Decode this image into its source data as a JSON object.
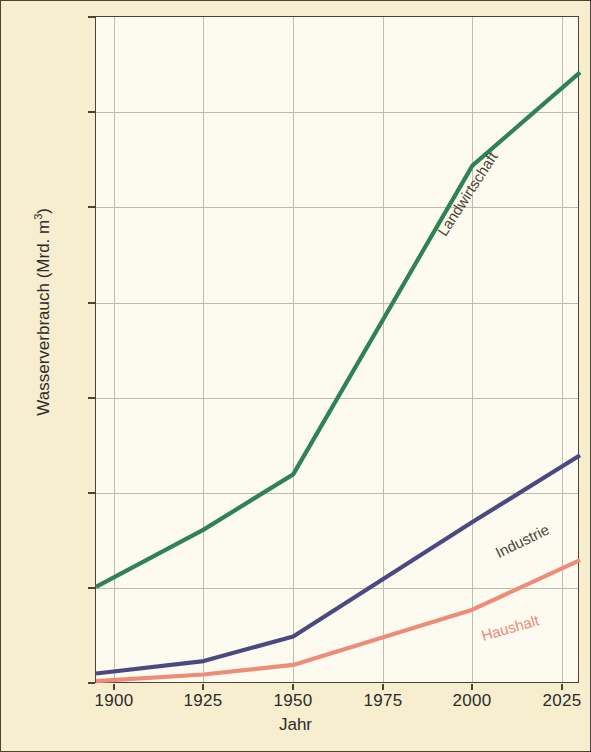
{
  "chart_data": {
    "type": "line",
    "title": "",
    "xlabel": "Jahr",
    "ylabel": "Wasserverbrauch (Mrd. m³)",
    "ylabel_main": "Wasserverbrauch (Mrd. m",
    "ylabel_sup": "3",
    "ylabel_tail": ")",
    "xlim": [
      1895,
      2030
    ],
    "ylim": [
      0,
      3500
    ],
    "grid": true,
    "legend": "inline-labels",
    "background_color": "#f7eed0",
    "plot_background_color": "#fdfbf0",
    "grid_color": "#bfbcae",
    "axis_color": "#4a4436",
    "yticks": [
      0,
      500,
      1000,
      1500,
      2000,
      2500,
      3000,
      3500
    ],
    "ytick_labels": [
      "0",
      "500",
      "1000",
      "1500",
      "2000",
      "2500",
      "3000",
      "3500"
    ],
    "xticks": [
      1900,
      1925,
      1950,
      1975,
      2000,
      2025
    ],
    "xtick_labels": [
      "1900",
      "1925",
      "1950",
      "1975",
      "2000",
      "2025"
    ],
    "series": [
      {
        "name": "Landwirtschaft",
        "color": "#2f8256",
        "label_color": "#4a4436",
        "x": [
          1895,
          1925,
          1950,
          2000,
          2030
        ],
        "values": [
          510,
          810,
          1100,
          2720,
          3210
        ]
      },
      {
        "name": "Industrie",
        "color": "#4b4a80",
        "label_color": "#4a4436",
        "x": [
          1895,
          1925,
          1950,
          2000,
          2030
        ],
        "values": [
          55,
          120,
          250,
          850,
          1200
        ]
      },
      {
        "name": "Haushalt",
        "color": "#ee8c79",
        "label_color": "#e98a78",
        "x": [
          1895,
          1925,
          1950,
          2000,
          2030
        ],
        "values": [
          15,
          50,
          100,
          390,
          650
        ]
      }
    ]
  }
}
